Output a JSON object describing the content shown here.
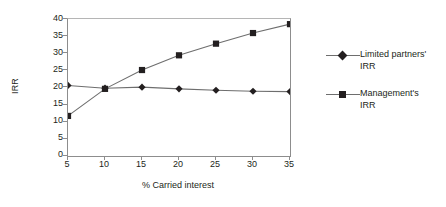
{
  "chart_data": {
    "type": "line",
    "title": "",
    "xlabel": "% Carried interest",
    "ylabel": "IRR",
    "x": [
      5,
      10,
      15,
      20,
      25,
      30,
      35
    ],
    "xticklabels": [
      "5",
      "10",
      "15",
      "20",
      "25",
      "30",
      "35"
    ],
    "yticklabels": [
      "0",
      "5",
      "10",
      "15",
      "20",
      "25",
      "30",
      "35",
      "40"
    ],
    "xlim": [
      5,
      35
    ],
    "ylim": [
      0,
      40
    ],
    "grid": false,
    "legend_position": "right",
    "series": [
      {
        "name": "Limited partners' IRR",
        "marker": "diamond",
        "color": "#231f20",
        "line_color": "#6e6e6e",
        "values": [
          20.6,
          19.8,
          20.1,
          19.6,
          19.2,
          18.9,
          18.8
        ]
      },
      {
        "name": "Management's IRR",
        "marker": "square",
        "color": "#231f20",
        "line_color": "#6e6e6e",
        "values": [
          11.7,
          19.6,
          25.1,
          29.4,
          32.8,
          35.9,
          38.5
        ]
      }
    ]
  },
  "axes": {
    "y_title": "IRR",
    "x_title": "% Carried interest",
    "y_ticks": [
      "40",
      "35",
      "30",
      "25",
      "20",
      "15",
      "10",
      "5",
      "0"
    ],
    "x_ticks": [
      "5",
      "10",
      "15",
      "20",
      "25",
      "30",
      "35"
    ]
  },
  "legend": {
    "entries": [
      {
        "label": "Limited partners'\nIRR",
        "marker": "diamond-marker"
      },
      {
        "label": "Management's\nIRR",
        "marker": "square-marker"
      }
    ]
  },
  "colors": {
    "axis": "#8d8d8d",
    "line": "#6e6e6e",
    "marker": "#231f20",
    "text": "#231f20",
    "background": "#ffffff"
  }
}
